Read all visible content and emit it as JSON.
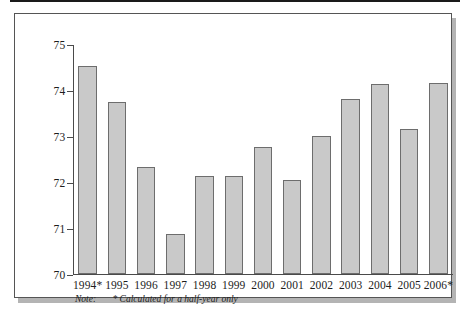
{
  "chart_data": {
    "type": "bar",
    "title": "",
    "xlabel": "",
    "ylabel": "Out of 100 Points",
    "ylim": [
      70,
      75
    ],
    "ytick_labels": [
      "75",
      "74",
      "73",
      "72",
      "71",
      "70"
    ],
    "yticks": [
      75,
      74,
      73,
      72,
      71,
      70
    ],
    "grid": false,
    "legend": null,
    "categories": [
      "1994*",
      "1995",
      "1996",
      "1997",
      "1998",
      "1999",
      "2000",
      "2001",
      "2002",
      "2003",
      "2004",
      "2005",
      "2006*"
    ],
    "values": [
      74.52,
      73.75,
      72.33,
      70.87,
      72.14,
      72.14,
      72.77,
      72.05,
      73.01,
      73.8,
      74.13,
      73.15,
      74.16
    ],
    "annotations": [
      {
        "label": "Note:",
        "text": "* Calculated for a half-year only"
      }
    ],
    "colors": {
      "bar_fill": "#c9c9c9",
      "bar_border": "#6d6d6d",
      "axis": "#4a4a4a",
      "text": "#1d1d1d",
      "frame": "#555555",
      "shadow": "#b4b4b4"
    }
  },
  "note": {
    "label": "Note:",
    "text": "* Calculated for a half-year only"
  }
}
